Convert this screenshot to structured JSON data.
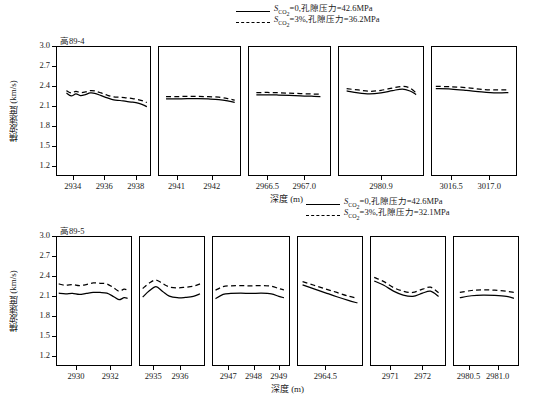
{
  "figure": {
    "caption": "",
    "axis_y_label": "横波速度 (km/s)",
    "axis_x_label": "深度 (m)",
    "y_ticks": [
      "3.0",
      "2.7",
      "2.4",
      "2.1",
      "1.8",
      "1.5",
      "1.2"
    ],
    "ylim": [
      1.05,
      3.0
    ],
    "line_color": "#000000"
  },
  "legend_top": {
    "items": [
      {
        "style": "solid",
        "prefix": "S",
        "sub": "CO",
        "sub2": "2",
        "text": "=0,孔隙压力=42.6MPa"
      },
      {
        "style": "dashed",
        "prefix": "S",
        "sub": "CO",
        "sub2": "2",
        "text": "=3%,孔隙压力=36.2MPa"
      }
    ]
  },
  "legend_bottom": {
    "items": [
      {
        "style": "solid",
        "prefix": "S",
        "sub": "CO",
        "sub2": "2",
        "text": "=0,孔隙压力=42.6MPa"
      },
      {
        "style": "dashed",
        "prefix": "S",
        "sub": "CO",
        "sub2": "2",
        "text": "=3%,孔隙压力=32.1MPa"
      }
    ]
  },
  "chart_data": [
    {
      "type": "line",
      "title": "高89-4",
      "well": "高89-4",
      "xlabel": "深度 (m)",
      "ylabel": "横波速度 (km/s)",
      "ylim": [
        1.05,
        3.0
      ],
      "grid": false,
      "legend_position": "top",
      "panels": [
        {
          "xticks": [
            "2934",
            "2936",
            "2938"
          ],
          "xlim": [
            2933.0,
            2938.9
          ],
          "series": [
            {
              "name": "S_CO2=0,孔隙压力=42.6MPa",
              "style": "solid",
              "x": [
                2933.6,
                2933.9,
                2934.2,
                2934.5,
                2934.8,
                2935.1,
                2935.4,
                2935.8,
                2936.2,
                2936.6,
                2937.0,
                2937.4,
                2937.8,
                2938.2,
                2938.5,
                2938.7
              ],
              "y": [
                2.3,
                2.255,
                2.285,
                2.26,
                2.275,
                2.3,
                2.295,
                2.26,
                2.225,
                2.195,
                2.185,
                2.17,
                2.16,
                2.14,
                2.115,
                2.09
              ]
            },
            {
              "name": "S_CO2=3%,孔隙压力=36.2MPa",
              "style": "dashed",
              "x": [
                2933.6,
                2933.9,
                2934.2,
                2934.5,
                2934.8,
                2935.1,
                2935.4,
                2935.8,
                2936.2,
                2936.6,
                2937.0,
                2937.4,
                2937.8,
                2938.2,
                2938.5,
                2938.7
              ],
              "y": [
                2.335,
                2.3,
                2.325,
                2.305,
                2.315,
                2.335,
                2.33,
                2.3,
                2.265,
                2.24,
                2.235,
                2.225,
                2.215,
                2.195,
                2.175,
                2.155
              ]
            }
          ]
        },
        {
          "xticks": [
            "2941",
            "2942"
          ],
          "xlim": [
            2940.5,
            2942.8
          ],
          "series": [
            {
              "name": "S_CO2=0,孔隙压力=42.6MPa",
              "style": "solid",
              "x": [
                2940.7,
                2941.0,
                2941.3,
                2941.6,
                2941.9,
                2942.2,
                2942.45,
                2942.65
              ],
              "y": [
                2.21,
                2.21,
                2.212,
                2.212,
                2.208,
                2.2,
                2.18,
                2.155
              ]
            },
            {
              "name": "S_CO2=3%,孔隙压力=36.2MPa",
              "style": "dashed",
              "x": [
                2940.7,
                2941.0,
                2941.3,
                2941.6,
                2941.9,
                2942.2,
                2942.45,
                2942.65
              ],
              "y": [
                2.245,
                2.245,
                2.248,
                2.248,
                2.243,
                2.235,
                2.215,
                2.19
              ]
            }
          ]
        },
        {
          "xticks": [
            "2966.5",
            "2967.0"
          ],
          "xlim": [
            2966.25,
            2967.35
          ],
          "series": [
            {
              "name": "S_CO2=0,孔隙压力=42.6MPa",
              "style": "solid",
              "x": [
                2966.35,
                2966.5,
                2966.65,
                2966.8,
                2966.95,
                2967.1,
                2967.22
              ],
              "y": [
                2.27,
                2.272,
                2.268,
                2.262,
                2.255,
                2.25,
                2.245
              ]
            },
            {
              "name": "S_CO2=3%,孔隙压力=36.2MPa",
              "style": "dashed",
              "x": [
                2966.35,
                2966.5,
                2966.65,
                2966.8,
                2966.95,
                2967.1,
                2967.22
              ],
              "y": [
                2.305,
                2.307,
                2.303,
                2.297,
                2.29,
                2.285,
                2.28
              ]
            }
          ]
        },
        {
          "xticks": [
            "2980.9"
          ],
          "xlim": [
            2980.35,
            2981.45
          ],
          "series": [
            {
              "name": "S_CO2=0,孔隙压力=42.6MPa",
              "style": "solid",
              "x": [
                2980.45,
                2980.6,
                2980.75,
                2980.9,
                2981.05,
                2981.18,
                2981.28,
                2981.36
              ],
              "y": [
                2.33,
                2.3,
                2.285,
                2.3,
                2.335,
                2.36,
                2.33,
                2.275
              ]
            },
            {
              "name": "S_CO2=3%,孔隙压力=36.2MPa",
              "style": "dashed",
              "x": [
                2980.45,
                2980.6,
                2980.75,
                2980.9,
                2981.05,
                2981.18,
                2981.28,
                2981.36
              ],
              "y": [
                2.365,
                2.345,
                2.325,
                2.34,
                2.375,
                2.4,
                2.375,
                2.3
              ]
            }
          ]
        },
        {
          "xticks": [
            "3016.5",
            "3017.0"
          ],
          "xlim": [
            3016.25,
            3017.35
          ],
          "series": [
            {
              "name": "S_CO2=0,孔隙压力=42.6MPa",
              "style": "solid",
              "x": [
                3016.3,
                3016.5,
                3016.7,
                3016.9,
                3017.1,
                3017.25
              ],
              "y": [
                2.365,
                2.36,
                2.34,
                2.315,
                2.3,
                2.305
              ]
            },
            {
              "name": "S_CO2=3%,孔隙压力=36.2MPa",
              "style": "dashed",
              "x": [
                3016.3,
                3016.5,
                3016.7,
                3016.9,
                3017.1,
                3017.25
              ],
              "y": [
                2.4,
                2.395,
                2.38,
                2.355,
                2.345,
                2.35
              ]
            }
          ]
        }
      ]
    },
    {
      "type": "line",
      "title": "高89-5",
      "well": "高89-5",
      "xlabel": "深度 (m)",
      "ylabel": "横波速度 (km/s)",
      "ylim": [
        1.05,
        3.0
      ],
      "grid": false,
      "legend_position": "top",
      "panels": [
        {
          "xticks": [
            "2930",
            "2932"
          ],
          "xlim": [
            2928.9,
            2933.2
          ],
          "series": [
            {
              "name": "S_CO2=0,孔隙压力=42.6MPa",
              "style": "solid",
              "x": [
                2929.0,
                2929.4,
                2929.8,
                2930.2,
                2930.6,
                2931.0,
                2931.4,
                2931.8,
                2932.2,
                2932.5,
                2932.8,
                2933.0
              ],
              "y": [
                2.145,
                2.135,
                2.14,
                2.125,
                2.14,
                2.155,
                2.155,
                2.145,
                2.09,
                2.045,
                2.075,
                2.065
              ]
            },
            {
              "name": "S_CO2=3%,孔隙压力=32.1MPa",
              "style": "dashed",
              "x": [
                2929.0,
                2929.4,
                2929.8,
                2930.2,
                2930.6,
                2931.0,
                2931.4,
                2931.8,
                2932.2,
                2932.5,
                2932.8,
                2933.0
              ],
              "y": [
                2.285,
                2.265,
                2.275,
                2.26,
                2.275,
                2.3,
                2.295,
                2.285,
                2.225,
                2.175,
                2.205,
                2.19
              ]
            }
          ]
        },
        {
          "xticks": [
            "2935",
            "2936"
          ],
          "xlim": [
            2934.5,
            2936.9
          ],
          "series": [
            {
              "name": "S_CO2=0,孔隙压力=42.6MPa",
              "style": "solid",
              "x": [
                2934.6,
                2934.85,
                2935.1,
                2935.35,
                2935.6,
                2935.9,
                2936.2,
                2936.5,
                2936.75
              ],
              "y": [
                2.085,
                2.18,
                2.245,
                2.17,
                2.1,
                2.075,
                2.08,
                2.095,
                2.135
              ]
            },
            {
              "name": "S_CO2=3%,孔隙压力=32.1MPa",
              "style": "dashed",
              "x": [
                2934.6,
                2934.85,
                2935.1,
                2935.35,
                2935.6,
                2935.9,
                2936.2,
                2936.5,
                2936.75
              ],
              "y": [
                2.215,
                2.3,
                2.345,
                2.29,
                2.24,
                2.225,
                2.235,
                2.25,
                2.285
              ]
            }
          ]
        },
        {
          "xticks": [
            "2947",
            "2948",
            "2949"
          ],
          "xlim": [
            2946.4,
            2949.4
          ],
          "series": [
            {
              "name": "S_CO2=0,孔隙压力=42.6MPa",
              "style": "solid",
              "x": [
                2946.5,
                2946.8,
                2947.1,
                2947.5,
                2947.9,
                2948.3,
                2948.7,
                2949.0,
                2949.2
              ],
              "y": [
                2.06,
                2.125,
                2.14,
                2.145,
                2.14,
                2.145,
                2.135,
                2.095,
                2.075
              ]
            },
            {
              "name": "S_CO2=3%,孔隙压力=32.1MPa",
              "style": "dashed",
              "x": [
                2946.5,
                2946.8,
                2947.1,
                2947.5,
                2947.9,
                2948.3,
                2948.7,
                2949.0,
                2949.2
              ],
              "y": [
                2.19,
                2.245,
                2.255,
                2.26,
                2.255,
                2.26,
                2.25,
                2.215,
                2.195
              ]
            }
          ]
        },
        {
          "xticks": [
            "2964.5"
          ],
          "xlim": [
            2963.9,
            2965.3
          ],
          "series": [
            {
              "name": "S_CO2=0,孔隙压力=42.6MPa",
              "style": "solid",
              "x": [
                2964.0,
                2964.25,
                2964.5,
                2964.75,
                2965.0,
                2965.2
              ],
              "y": [
                2.27,
                2.21,
                2.15,
                2.09,
                2.035,
                1.995
              ]
            },
            {
              "name": "S_CO2=3%,孔隙压力=32.1MPa",
              "style": "dashed",
              "x": [
                2964.0,
                2964.25,
                2964.5,
                2964.75,
                2965.0,
                2965.2
              ],
              "y": [
                2.32,
                2.265,
                2.21,
                2.155,
                2.1,
                2.065
              ]
            }
          ]
        },
        {
          "xticks": [
            "2971",
            "2972"
          ],
          "xlim": [
            2970.4,
            2972.7
          ],
          "series": [
            {
              "name": "S_CO2=0,孔隙压力=42.6MPa",
              "style": "solid",
              "x": [
                2970.5,
                2970.8,
                2971.1,
                2971.4,
                2971.7,
                2972.0,
                2972.25,
                2972.5
              ],
              "y": [
                2.33,
                2.265,
                2.175,
                2.115,
                2.095,
                2.145,
                2.175,
                2.095
              ]
            },
            {
              "name": "S_CO2=3%,孔隙压力=32.1MPa",
              "style": "dashed",
              "x": [
                2970.5,
                2970.8,
                2971.1,
                2971.4,
                2971.7,
                2972.0,
                2972.25,
                2972.5
              ],
              "y": [
                2.385,
                2.32,
                2.23,
                2.175,
                2.155,
                2.205,
                2.235,
                2.15
              ]
            }
          ]
        },
        {
          "xticks": [
            "2980.5",
            "2981.0"
          ],
          "xlim": [
            2980.25,
            2981.35
          ],
          "series": [
            {
              "name": "S_CO2=0,孔隙压力=42.6MPa",
              "style": "solid",
              "x": [
                2980.35,
                2980.55,
                2980.75,
                2980.95,
                2981.15,
                2981.28
              ],
              "y": [
                2.075,
                2.105,
                2.115,
                2.11,
                2.095,
                2.065
              ]
            },
            {
              "name": "S_CO2=3%,孔隙压力=32.1MPa",
              "style": "dashed",
              "x": [
                2980.35,
                2980.55,
                2980.75,
                2980.95,
                2981.15,
                2981.28
              ],
              "y": [
                2.155,
                2.185,
                2.195,
                2.19,
                2.175,
                2.155
              ]
            }
          ]
        }
      ]
    }
  ]
}
